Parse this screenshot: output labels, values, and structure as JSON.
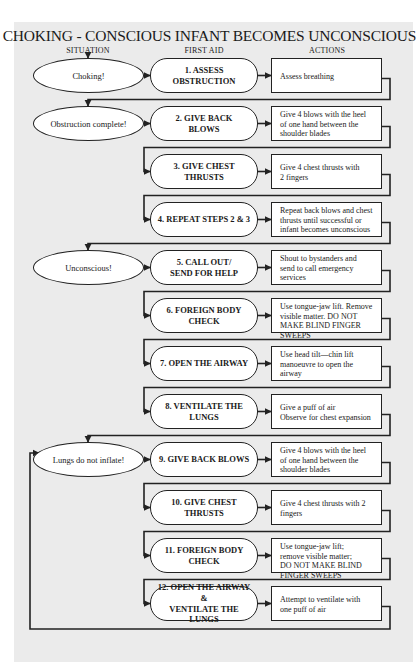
{
  "title": "CHOKING - CONSCIOUS INFANT BECOMES UNCONSCIOUS",
  "columns": {
    "situation": "SITUATION",
    "first_aid": "FIRST AID",
    "actions": "ACTIONS"
  },
  "colors": {
    "panel": "#ebebeb",
    "box_fill": "#ffffff",
    "line": "#222222"
  },
  "situations": [
    {
      "label": "Choking!",
      "row": 1
    },
    {
      "label": "Obstruction complete!",
      "row": 2
    },
    {
      "label": "Unconscious!",
      "row": 5
    },
    {
      "label": "Lungs do not inflate!",
      "row": 9
    }
  ],
  "steps": [
    {
      "label": "1. ASSESS OBSTRUCTION",
      "action": "Assess breathing"
    },
    {
      "label": "2. GIVE BACK\nBLOWS",
      "action": "Give 4 blows with the heel\nof one hand between the\nshoulder blades"
    },
    {
      "label": "3. GIVE CHEST\nTHRUSTS",
      "action": "Give 4 chest thrusts with\n2 fingers"
    },
    {
      "label": "4. REPEAT STEPS 2 & 3",
      "action": "Repeat back blows and chest\nthrusts until successful or\ninfant becomes unconscious"
    },
    {
      "label": "5. CALL OUT/\nSEND FOR HELP",
      "action": "Shout to bystanders and\nsend to call emergency\nservices"
    },
    {
      "label": "6. FOREIGN BODY\nCHECK",
      "action": "Use tongue-jaw lift. Remove\nvisible matter. DO NOT\nMAKE BLIND FINGER\nSWEEPS"
    },
    {
      "label": "7. OPEN THE AIRWAY",
      "action": "Use head tilt—chin lift\nmanoeuvre to open the\nairway"
    },
    {
      "label": "8. VENTILATE THE\nLUNGS",
      "action": "Give a puff of air\nObserve for chest expansion"
    },
    {
      "label": "9. GIVE BACK BLOWS",
      "action": "Give 4 blows with the heel\nof one hand between the\nshoulder blades"
    },
    {
      "label": "10. GIVE CHEST\nTHRUSTS",
      "action": "Give 4 chest thrusts with 2\nfingers"
    },
    {
      "label": "11. FOREIGN BODY\nCHECK",
      "action": "Use tongue-jaw lift;\nremove visible matter;\nDO NOT MAKE BLIND\nFINGER SWEEPS"
    },
    {
      "label": "12. OPEN THE AIRWAY &\nVENTILATE THE\nLUNGS",
      "action": "Attempt to ventilate with\none puff of air"
    }
  ]
}
